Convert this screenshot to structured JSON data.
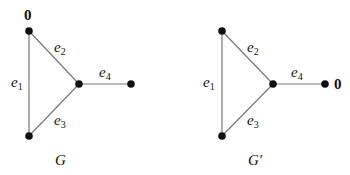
{
  "graphs": [
    {
      "name": "G",
      "caption": "G",
      "nodes": [
        {
          "id": "top",
          "x": 29,
          "y": 31,
          "label": "0"
        },
        {
          "id": "center",
          "x": 79,
          "y": 84,
          "label": ""
        },
        {
          "id": "right",
          "x": 131,
          "y": 84,
          "label": ""
        },
        {
          "id": "bottom",
          "x": 29,
          "y": 136,
          "label": ""
        }
      ],
      "edges": [
        {
          "label": "e",
          "sub": "1",
          "from": "top",
          "to": "bottom"
        },
        {
          "label": "e",
          "sub": "2",
          "from": "top",
          "to": "center"
        },
        {
          "label": "e",
          "sub": "3",
          "from": "bottom",
          "to": "center"
        },
        {
          "label": "e",
          "sub": "4",
          "from": "center",
          "to": "right"
        }
      ]
    },
    {
      "name": "G'",
      "caption": "G′",
      "nodes": [
        {
          "id": "top",
          "x": 222,
          "y": 31,
          "label": ""
        },
        {
          "id": "center",
          "x": 273,
          "y": 84,
          "label": ""
        },
        {
          "id": "right",
          "x": 325,
          "y": 84,
          "label": "0"
        },
        {
          "id": "bottom",
          "x": 222,
          "y": 136,
          "label": ""
        }
      ],
      "edges": [
        {
          "label": "e",
          "sub": "1",
          "from": "top",
          "to": "bottom"
        },
        {
          "label": "e",
          "sub": "2",
          "from": "top",
          "to": "center"
        },
        {
          "label": "e",
          "sub": "3",
          "from": "bottom",
          "to": "center"
        },
        {
          "label": "e",
          "sub": "4",
          "from": "center",
          "to": "right"
        }
      ]
    }
  ],
  "colors": {
    "edge": "#777777",
    "node": "#111111",
    "text": "#111111"
  }
}
